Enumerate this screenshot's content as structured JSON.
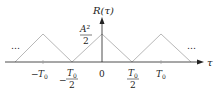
{
  "diagram": {
    "y_axis_label": "R(τ)",
    "x_axis_label": "τ",
    "peak_label": {
      "numerator": "A²",
      "denominator": "2"
    },
    "ellipsis_left": "…",
    "ellipsis_right": "…",
    "ticks": {
      "neg_T0": {
        "prefix": "−",
        "sym": "T",
        "sub": "0"
      },
      "neg_half_T0": {
        "prefix": "−",
        "num_sym": "T",
        "num_sub": "0",
        "den": "2"
      },
      "zero": "0",
      "half_T0": {
        "num_sym": "T",
        "num_sub": "0",
        "den": "2"
      },
      "T0": {
        "sym": "T",
        "sub": "0"
      }
    },
    "line_color": "#b8b8b8",
    "axis_color": "#222222"
  }
}
